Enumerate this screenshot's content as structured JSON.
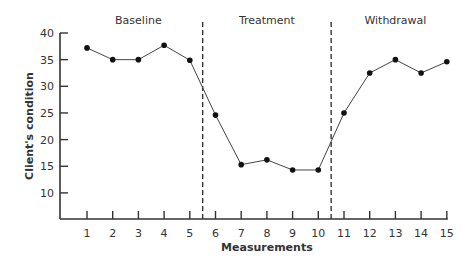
{
  "chart_data": {
    "type": "line",
    "title": "",
    "xlabel": "Measurements",
    "ylabel": "Client's condition",
    "xlim": [
      0,
      15
    ],
    "ylim": [
      5,
      40
    ],
    "x_ticks": [
      1,
      2,
      3,
      4,
      5,
      6,
      7,
      8,
      9,
      10,
      11,
      12,
      13,
      14,
      15
    ],
    "y_ticks": [
      10,
      15,
      20,
      25,
      30,
      35,
      40
    ],
    "grid": false,
    "phases": [
      {
        "label": "Baseline",
        "x_range": [
          1,
          5
        ]
      },
      {
        "label": "Treatment",
        "x_range": [
          6,
          10
        ]
      },
      {
        "label": "Withdrawal",
        "x_range": [
          11,
          15
        ]
      }
    ],
    "phase_dividers": [
      5.5,
      10.5
    ],
    "series": [
      {
        "name": "Client's condition",
        "x": [
          1,
          2,
          3,
          4,
          5,
          6,
          7,
          8,
          9,
          10,
          11,
          12,
          13,
          14,
          15
        ],
        "values": [
          37.2,
          35,
          35,
          37.7,
          34.9,
          24.6,
          15.3,
          16.2,
          14.3,
          14.3,
          25,
          32.5,
          35,
          32.5,
          34.6
        ]
      }
    ]
  }
}
